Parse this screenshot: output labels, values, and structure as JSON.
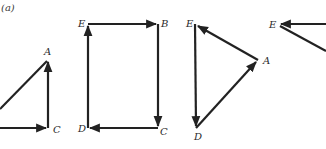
{
  "figure": {
    "panel_label": "(a)",
    "stroke_color": "#222222",
    "background": "#ffffff",
    "diagrams": [
      {
        "name": "triangle-ac",
        "labels": [
          "A",
          "C"
        ],
        "vectors": [
          "left→C",
          "C→A",
          "A→left"
        ]
      },
      {
        "name": "rectangle-ebcd",
        "labels": [
          "E",
          "B",
          "C",
          "D"
        ],
        "vectors": [
          "E→B",
          "B→C",
          "C→D",
          "D→E"
        ]
      },
      {
        "name": "triangle-ead",
        "labels": [
          "E",
          "A",
          "D"
        ],
        "vectors": [
          "A→E",
          "E→D",
          "D→A"
        ]
      },
      {
        "name": "partial-triangle-e",
        "labels": [
          "E"
        ],
        "vectors": [
          "right→E",
          "E→lower-right"
        ]
      }
    ]
  }
}
